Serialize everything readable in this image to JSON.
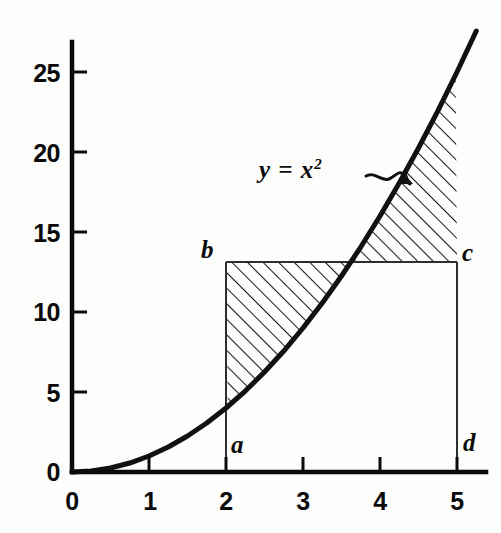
{
  "chart_data": {
    "type": "line",
    "title": "",
    "xlabel": "",
    "ylabel": "",
    "function": "y = x^2",
    "equation_label": "y = x",
    "equation_exponent": "2",
    "xlim": [
      0,
      5.25
    ],
    "ylim": [
      0,
      27.5
    ],
    "grid": false,
    "legend": "none",
    "x_ticks": [
      "0",
      "1",
      "2",
      "3",
      "4",
      "5"
    ],
    "x_tick_values": [
      0,
      1,
      2,
      3,
      4,
      5
    ],
    "y_ticks": [
      "0",
      "5",
      "10",
      "15",
      "20",
      "25"
    ],
    "y_tick_values": [
      0,
      5,
      10,
      15,
      20,
      25
    ],
    "series": [
      {
        "name": "y = x^2",
        "x": [
          0,
          0.25,
          0.5,
          0.75,
          1,
          1.25,
          1.5,
          1.75,
          2,
          2.25,
          2.5,
          2.75,
          3,
          3.25,
          3.5,
          3.75,
          4,
          4.25,
          4.5,
          4.75,
          5,
          5.25
        ],
        "values": [
          0,
          0.06,
          0.25,
          0.56,
          1,
          1.56,
          2.25,
          3.06,
          4,
          5.06,
          6.25,
          7.56,
          9,
          10.56,
          12.25,
          14.06,
          16,
          18.06,
          20.25,
          22.56,
          25,
          27.56
        ]
      }
    ],
    "annotations": {
      "rectangle": {
        "x_left": 2,
        "x_right": 5,
        "y_top": 13.125,
        "y_bottom": 0,
        "corner_labels": {
          "top_left": "b",
          "top_right": "c",
          "bottom_left": "a",
          "bottom_right": "d"
        }
      },
      "intersection_x": 3.623,
      "hatched_regions": [
        {
          "name": "left-region-above-curve-below-bc",
          "x_from": 2,
          "x_to": 3.623,
          "upper": "y = 13.125",
          "lower": "y = x^2"
        },
        {
          "name": "right-region-above-bc-below-curve",
          "x_from": 3.623,
          "x_to": 5,
          "upper": "y = x^2",
          "lower": "y = 13.125"
        }
      ],
      "curve_label": "y = x²",
      "curve_label_x": 2.95,
      "curve_label_y": 19.0
    },
    "colors": {
      "background": "#fdfdfb",
      "ink": "#0b0b0b",
      "curve": "#111111",
      "thin_line": "#3a3a3a",
      "hatch": "#1a1a1a"
    }
  },
  "axes": {
    "y_tick_labels": [
      {
        "text": "25",
        "value": 25
      },
      {
        "text": "20",
        "value": 20
      },
      {
        "text": "15",
        "value": 15
      },
      {
        "text": "10",
        "value": 10
      },
      {
        "text": "5",
        "value": 5
      },
      {
        "text": "0",
        "value": 0
      }
    ],
    "x_tick_labels": [
      {
        "text": "0",
        "value": 0
      },
      {
        "text": "1",
        "value": 1
      },
      {
        "text": "2",
        "value": 2
      },
      {
        "text": "3",
        "value": 3
      },
      {
        "text": "4",
        "value": 4
      },
      {
        "text": "5",
        "value": 5
      }
    ]
  },
  "labels": {
    "point_a": "a",
    "point_b": "b",
    "point_c": "c",
    "point_d": "d",
    "equation_main": "y = x",
    "equation_sup": "2"
  }
}
